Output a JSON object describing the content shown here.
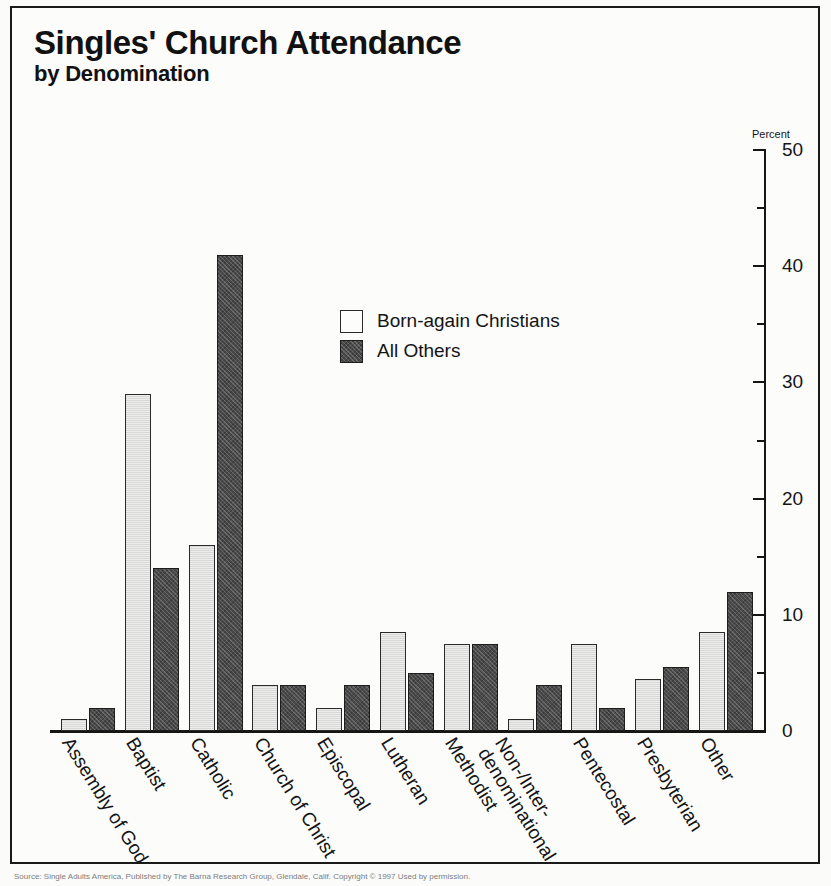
{
  "title": {
    "main": "Singles' Church Attendance",
    "sub": "by Denomination"
  },
  "footer": {
    "source": "Source: Single Adults America, Published by The Barna Research Group, Glendale, Calif. Copyright © 1997 Used by permission."
  },
  "chart_data": {
    "type": "bar",
    "title": "Singles' Church Attendance by Denomination",
    "xlabel": "",
    "ylabel": "Percent",
    "ylim": [
      0,
      50
    ],
    "yticks": [
      0,
      10,
      20,
      30,
      40,
      50
    ],
    "ytick_labels": [
      "0",
      "10",
      "20",
      "30",
      "40",
      "50"
    ],
    "minor_yticks": [
      5,
      15,
      25,
      35,
      45
    ],
    "grid": false,
    "legend_position": "inside-upper-center",
    "axis_unit_label": "Percent",
    "categories": [
      "Assembly of God",
      "Baptist",
      "Catholic",
      "Church of Christ",
      "Episcopal",
      "Lutheran",
      "Methodist",
      "Non-/Inter-denominational",
      "Pentecostal",
      "Presbyterian",
      "Other"
    ],
    "category_lines": [
      [
        "Assembly of God"
      ],
      [
        "Baptist"
      ],
      [
        "Catholic"
      ],
      [
        "Church of Christ"
      ],
      [
        "Episcopal"
      ],
      [
        "Lutheran"
      ],
      [
        "Methodist"
      ],
      [
        "Non-/Inter-",
        "denominational"
      ],
      [
        "Pentecostal"
      ],
      [
        "Presbyterian"
      ],
      [
        "Other"
      ]
    ],
    "series": [
      {
        "name": "Born-again Christians",
        "color": "#d8d8d6",
        "values": [
          1,
          29,
          16,
          4,
          2,
          8.5,
          7.5,
          1,
          7.5,
          4.5,
          8.5
        ]
      },
      {
        "name": "All Others",
        "color": "#4a4a4a",
        "values": [
          2,
          14,
          41,
          4,
          4,
          5,
          7.5,
          4,
          2,
          5.5,
          12
        ]
      }
    ]
  }
}
